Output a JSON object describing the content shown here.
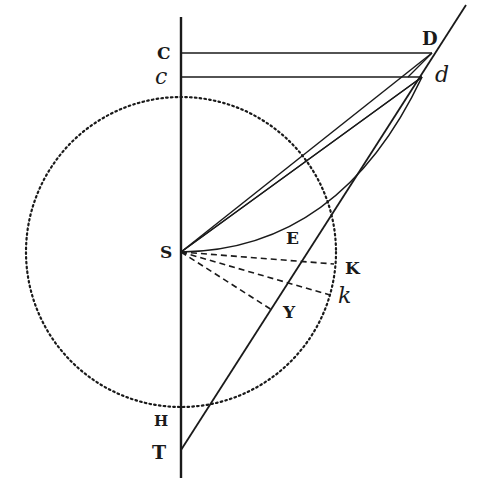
{
  "figure": {
    "stroke_color": "#1a1a1a",
    "background": "#ffffff",
    "labels": {
      "C": "C",
      "c": "c",
      "D": "D",
      "d": "d",
      "S": "S",
      "E": "E",
      "K": "K",
      "k": "k",
      "Y": "Y",
      "H": "H",
      "T": "T"
    },
    "points": {
      "C": [
        181,
        53
      ],
      "c": [
        181,
        77
      ],
      "D": [
        432,
        53
      ],
      "d": [
        422,
        77
      ],
      "S": [
        181,
        252
      ],
      "T": [
        181,
        450
      ],
      "K": [
        338,
        262
      ],
      "k": [
        334,
        292
      ],
      "Y": [
        275,
        322
      ],
      "H": [
        181,
        405
      ]
    },
    "circle": {
      "center": [
        181,
        252
      ],
      "radius": 155,
      "style": "dotted"
    }
  }
}
